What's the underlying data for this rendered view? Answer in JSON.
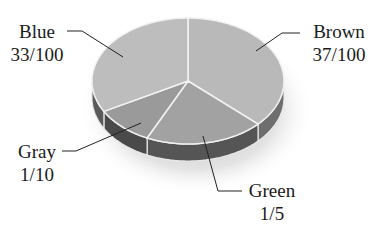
{
  "chart_data": {
    "type": "pie",
    "style": "3d",
    "title": "",
    "slices": [
      {
        "label": "Brown",
        "value_text": "37/100",
        "value": 0.37,
        "color": "#b9b9b9"
      },
      {
        "label": "Green",
        "value_text": "1/5",
        "value": 0.2,
        "color": "#a2a2a2"
      },
      {
        "label": "Gray",
        "value_text": "1/10",
        "value": 0.1,
        "color": "#9a9a9a"
      },
      {
        "label": "Blue",
        "value_text": "33/100",
        "value": 0.33,
        "color": "#bdbdbd"
      }
    ],
    "start_angle_deg": 90,
    "direction": "clockwise",
    "legend": "none",
    "labels_position": "outside-with-leader-lines"
  },
  "labels": {
    "blue": {
      "name": "Blue",
      "value": "33/100"
    },
    "brown": {
      "name": "Brown",
      "value": "37/100"
    },
    "gray": {
      "name": "Gray",
      "value": "1/10"
    },
    "green": {
      "name": "Green",
      "value": "1/5"
    }
  }
}
